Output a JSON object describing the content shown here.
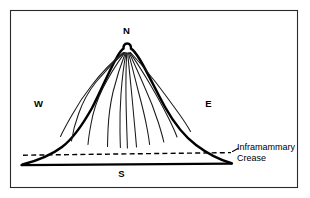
{
  "figure": {
    "frame": {
      "present": true,
      "stroke_color": "#2a2a2a"
    },
    "ink_color": "#000000",
    "background_color": "#ffffff"
  },
  "compass_labels": {
    "north": "N",
    "south": "S",
    "east": "E",
    "west": "W"
  },
  "annotations": {
    "crease_line1": "Inframammary",
    "crease_line2": "Crease"
  },
  "anatomy": {
    "nipple_name": "nipple-apex",
    "contour_name": "breast-contour",
    "duct_count": 11,
    "crease_style": "dashed",
    "chest_wall_style": "solid"
  }
}
